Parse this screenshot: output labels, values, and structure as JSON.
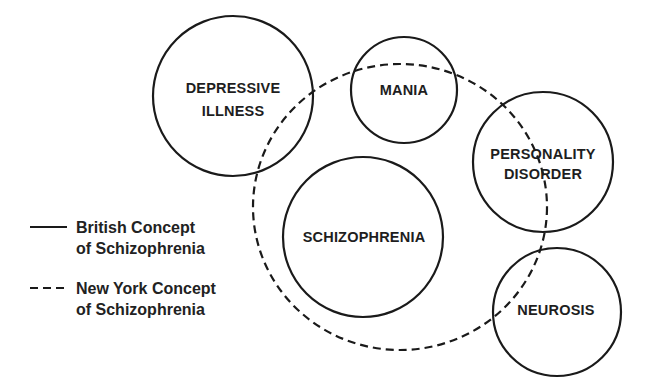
{
  "diagram": {
    "type": "venn-overlap",
    "colors": {
      "stroke": "#1a1a1a",
      "text": "#1e1e1e",
      "background": "#ffffff"
    },
    "circles": [
      {
        "id": "depressive-illness",
        "lines": [
          "DEPRESSIVE",
          "ILLNESS"
        ],
        "cx": 233,
        "cy": 96,
        "r": 80
      },
      {
        "id": "mania",
        "lines": [
          "MANIA"
        ],
        "cx": 404,
        "cy": 90,
        "r": 53
      },
      {
        "id": "personality-disorder",
        "lines": [
          "PERSONALITY",
          "DISORDER"
        ],
        "cx": 543,
        "cy": 162,
        "r": 70
      },
      {
        "id": "schizophrenia",
        "lines": [
          "SCHIZOPHRENIA"
        ],
        "cx": 363,
        "cy": 237,
        "r": 80
      },
      {
        "id": "neurosis",
        "lines": [
          "NEUROSIS"
        ],
        "cx": 557,
        "cy": 312,
        "r": 64
      }
    ],
    "dashed_boundary": {
      "cx": 400,
      "cy": 207,
      "rx": 147,
      "ry": 143
    },
    "legend": [
      {
        "style": "solid",
        "line1": "British Concept",
        "line2": "of Schizophrenia"
      },
      {
        "style": "dashed",
        "line1": "New York Concept",
        "line2": "of Schizophrenia"
      }
    ]
  }
}
